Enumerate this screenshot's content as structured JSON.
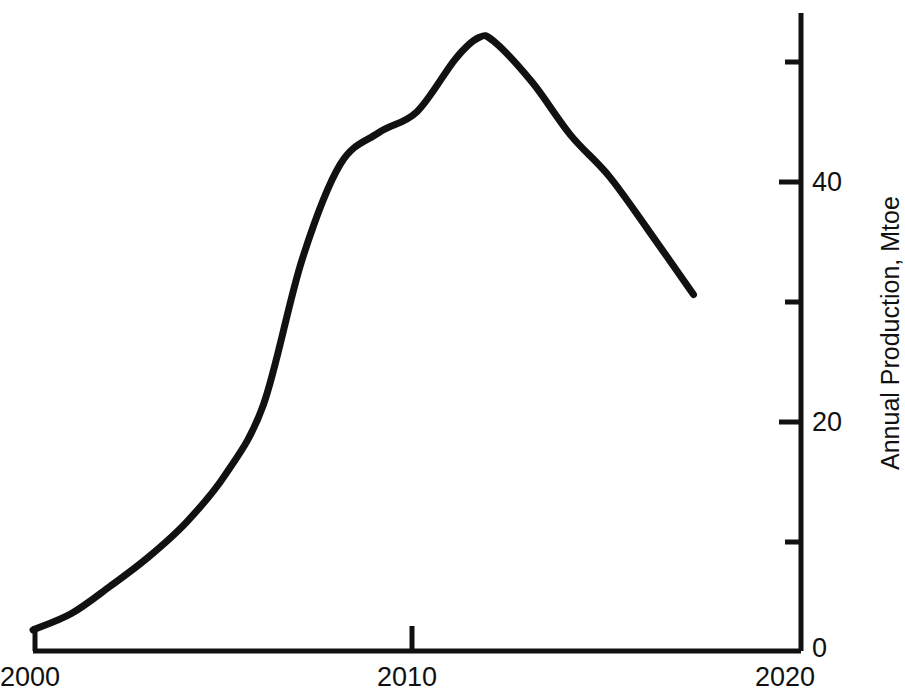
{
  "chart_data": {
    "type": "line",
    "title": "",
    "subtitle": "",
    "xlabel": "",
    "ylabel": "Annual Production, Mtoe",
    "xlim": [
      2000,
      2020
    ],
    "ylim": [
      0,
      53
    ],
    "grid": false,
    "legend": null,
    "legend_position": "none",
    "x_ticks_major": [
      "2000",
      "2010",
      "2020"
    ],
    "x_tick_values": [
      2000,
      2010,
      2020
    ],
    "y_ticks_major": [
      "0",
      "20",
      "40"
    ],
    "y_tick_values_major": [
      0,
      20,
      40
    ],
    "y_tick_values_minor": [
      10,
      30,
      50
    ],
    "y_axis_side": "right",
    "x": [
      2000,
      2001,
      2002,
      2003,
      2004,
      2005,
      2006,
      2007,
      2008,
      2009,
      2010,
      2011,
      2011.6,
      2012,
      2013,
      2014,
      2015,
      2016,
      2017.2
    ],
    "values": [
      1.8,
      3.2,
      5.5,
      8.0,
      11.0,
      15.0,
      21.0,
      33.3,
      41.5,
      44.2,
      46.0,
      50.5,
      52.3,
      52.0,
      48.5,
      44.0,
      40.5,
      36.0,
      30.4
    ],
    "series": [
      {
        "name": "Annual Production",
        "color": "#111111",
        "line_width": 7,
        "values": [
          1.8,
          3.2,
          5.5,
          8.0,
          11.0,
          15.0,
          21.0,
          33.3,
          41.5,
          44.2,
          46.0,
          50.5,
          52.3,
          52.0,
          48.5,
          44.0,
          40.5,
          36.0,
          30.4
        ]
      }
    ],
    "annotations": []
  },
  "axis_labels": {
    "x_2000": "2000",
    "x_2010": "2010",
    "x_2020": "2020",
    "y_0": "0",
    "y_20": "20",
    "y_40": "40",
    "y_title": "Annual Production, Mtoe"
  },
  "colors": {
    "line": "#111111",
    "axis": "#111111",
    "background": "#ffffff"
  }
}
